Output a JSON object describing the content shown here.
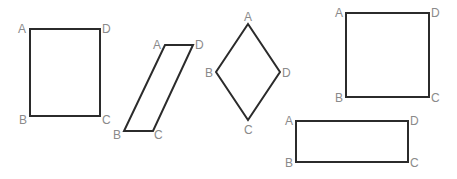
{
  "shapes": [
    {
      "name": "rectangle-1",
      "kind": "rectangle",
      "labels": {
        "A": "A",
        "B": "B",
        "C": "C",
        "D": "D"
      }
    },
    {
      "name": "parallelogram",
      "kind": "parallelogram",
      "labels": {
        "A": "A",
        "B": "B",
        "C": "C",
        "D": "D"
      }
    },
    {
      "name": "rhombus",
      "kind": "rhombus",
      "labels": {
        "A": "A",
        "B": "B",
        "C": "C",
        "D": "D"
      }
    },
    {
      "name": "square",
      "kind": "square",
      "labels": {
        "A": "A",
        "B": "B",
        "C": "C",
        "D": "D"
      }
    },
    {
      "name": "rectangle-2",
      "kind": "rectangle",
      "labels": {
        "A": "A",
        "B": "B",
        "C": "C",
        "D": "D"
      }
    }
  ]
}
